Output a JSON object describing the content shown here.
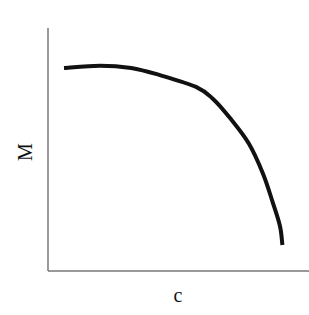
{
  "chart_data": {
    "type": "line",
    "title": "",
    "xlabel": "c",
    "ylabel": "M",
    "xlim": [
      0,
      1
    ],
    "ylim": [
      0,
      1
    ],
    "grid": false,
    "legend": null,
    "ticks": {
      "x": [],
      "y": []
    },
    "series": [
      {
        "name": "M vs c",
        "color": "#111111",
        "x": [
          0.0,
          0.15,
          0.28,
          0.4,
          0.55,
          0.62,
          0.69,
          0.77,
          0.83,
          0.87,
          0.9,
          0.91
        ],
        "y": [
          0.86,
          0.87,
          0.86,
          0.83,
          0.78,
          0.73,
          0.65,
          0.54,
          0.41,
          0.29,
          0.19,
          0.11
        ]
      }
    ]
  },
  "colors": {
    "axis": "#777777",
    "curve": "#111111",
    "background": "#ffffff"
  }
}
